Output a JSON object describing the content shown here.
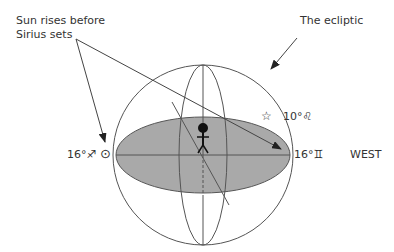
{
  "labels": {
    "sun_rises_line1": "Sun rises before",
    "sun_rises_line2": "Sirius sets",
    "ecliptic": "The ecliptic",
    "left_point": "16°♐",
    "sun_symbol": "⊙",
    "star_label": "10°♌",
    "star_symbol": "☆",
    "right_point": "16°♊",
    "west": "WEST"
  },
  "colors": {
    "ellipse_fill": "#a9a9a9",
    "line": "#444444",
    "text": "#333333"
  }
}
